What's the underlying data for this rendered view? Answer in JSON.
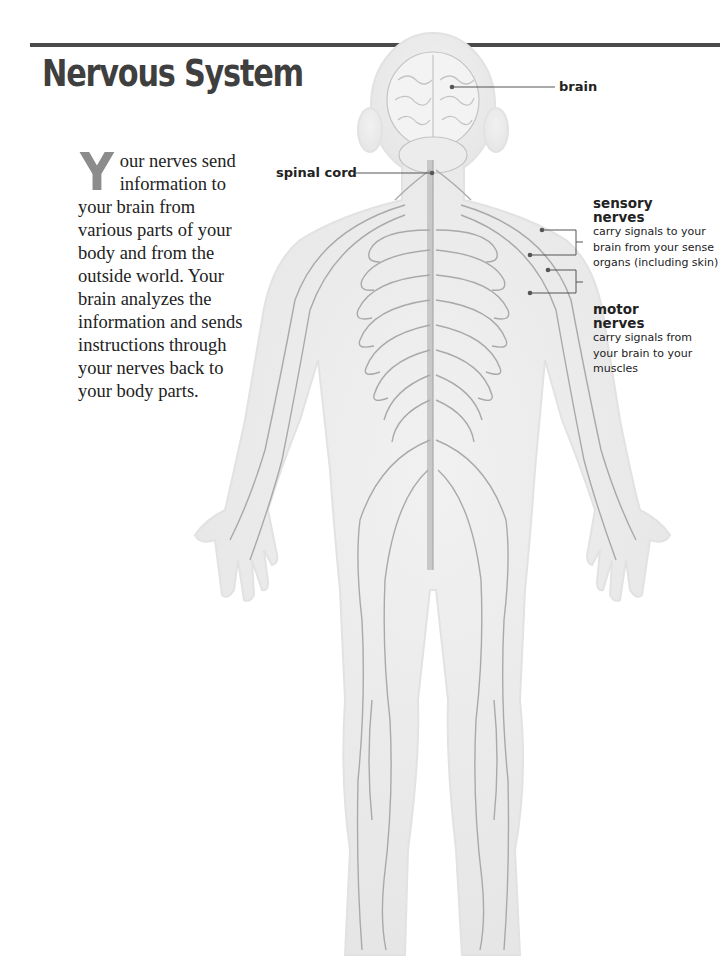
{
  "page": {
    "title": "Nervous System",
    "intro": {
      "drop_cap": "Y",
      "text": "our nerves send information to your brain from various parts of your body and from the outside world. Your brain analyzes the information and sends instructions through your nerves back to your body parts."
    }
  },
  "figure": {
    "labels": {
      "brain": "brain",
      "spinal_cord": "spinal cord",
      "sensory": {
        "heading_line1": "sensory",
        "heading_line2": "nerves",
        "description": "carry signals to your brain from your sense organs (including skin)"
      },
      "motor": {
        "heading_line1": "motor",
        "heading_line2": "nerves",
        "description": "carry signals from your brain to your muscles"
      }
    },
    "colors": {
      "body_fill": "#ececec",
      "body_edge": "#e0e0e0",
      "nerve": "#a9a9a9",
      "leader": "#555555",
      "rule": "#4a4a4a",
      "title": "#3f3f3f",
      "drop_cap": "#8c8c8c"
    }
  }
}
